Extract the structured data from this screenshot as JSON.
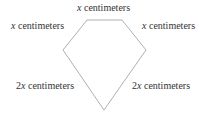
{
  "diagram": {
    "shape": "pentagon",
    "stroke_color": "#b0b0b0",
    "vertices": [
      [
        87,
        20
      ],
      [
        122,
        20
      ],
      [
        146,
        50
      ],
      [
        104,
        110
      ],
      [
        63,
        50
      ]
    ],
    "labels": {
      "top": {
        "coef": "",
        "var": "x",
        "unit": " centimeters"
      },
      "upper_left": {
        "coef": "",
        "var": "x",
        "unit": " centimeters"
      },
      "upper_right": {
        "coef": "",
        "var": "x",
        "unit": " centimeters"
      },
      "lower_left": {
        "coef": "2",
        "var": "x",
        "unit": " centimeters"
      },
      "lower_right": {
        "coef": "2",
        "var": "x",
        "unit": " centimeters"
      }
    }
  }
}
